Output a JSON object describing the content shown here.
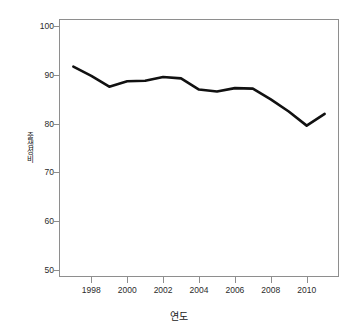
{
  "chart_data": {
    "type": "line",
    "title": "",
    "xlabel": "연도",
    "ylabel": "출생성비",
    "x": [
      1997,
      1998,
      1999,
      2000,
      2001,
      2002,
      2003,
      2004,
      2005,
      2006,
      2007,
      2008,
      2009,
      2010,
      2011
    ],
    "values": [
      91.7,
      89.8,
      87.6,
      88.7,
      88.8,
      89.6,
      89.3,
      87.0,
      86.6,
      87.3,
      87.2,
      85.0,
      82.5,
      79.6,
      82.0
    ],
    "series": [
      {
        "name": "출생성비",
        "values": [
          91.7,
          89.8,
          87.6,
          88.7,
          88.8,
          89.6,
          89.3,
          87.0,
          86.6,
          87.3,
          87.2,
          85.0,
          82.5,
          79.6,
          82.0
        ]
      }
    ],
    "xlim": [
      1996.2,
      1996.2
    ],
    "xaxis_range": [
      1996.2,
      2011.8
    ],
    "ylim": [
      48.5,
      101.5
    ],
    "ytick_labels": [
      "50",
      "60",
      "70",
      "80",
      "90",
      "100"
    ],
    "ytick_values": [
      50,
      60,
      70,
      80,
      90,
      100
    ],
    "xtick_labels": [
      "1998",
      "2000",
      "2002",
      "2004",
      "2006",
      "2008",
      "2010"
    ],
    "xtick_values": [
      1998,
      2000,
      2002,
      2004,
      2006,
      2008,
      2010
    ],
    "grid": false,
    "legend": "none",
    "line_color": "#111111",
    "line_width": 2.6,
    "axis_color": "#8e8e8e",
    "text_color": "#2b2b2b",
    "background": "#ffffff"
  }
}
